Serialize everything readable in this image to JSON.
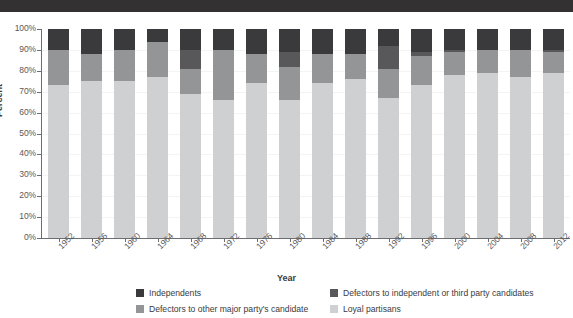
{
  "title_band": {
    "text": ""
  },
  "axes": {
    "ylabel": "Percent",
    "xlabel": "Year",
    "yticks": [
      "0%",
      "10%",
      "20%",
      "30%",
      "40%",
      "50%",
      "60%",
      "70%",
      "80%",
      "90%",
      "100%"
    ]
  },
  "legend": {
    "items": [
      {
        "label": "Independents",
        "color": "#3a3a3c",
        "col": 0,
        "row": 0
      },
      {
        "label": "Defectors to independent or third party candidates",
        "color": "#58585b",
        "col": 1,
        "row": 0
      },
      {
        "label": "Defectors to other major party's candidate",
        "color": "#939597",
        "col": 0,
        "row": 1
      },
      {
        "label": "Loyal partisans",
        "color": "#cfd0d2",
        "col": 1,
        "row": 1
      }
    ]
  },
  "colors": {
    "independents": "#3a3a3c",
    "defectors_independent_third": "#58585b",
    "defectors_other_major": "#939597",
    "loyal_partisans": "#cfd0d2",
    "axis": "#6d6e71",
    "title_band": "#333132",
    "background": "#ffffff"
  },
  "chart_data": {
    "type": "bar",
    "stacked": true,
    "stack_total": 100,
    "title": "",
    "xlabel": "Year",
    "ylabel": "Percent",
    "ylim": [
      0,
      100
    ],
    "ytick_step": 10,
    "grid": false,
    "legend_position": "bottom",
    "categories": [
      "1952",
      "1956",
      "1960",
      "1964",
      "1968",
      "1972",
      "1976",
      "1980",
      "1984",
      "1988",
      "1992",
      "1996",
      "2000",
      "2004",
      "2008",
      "2012"
    ],
    "series": [
      {
        "name": "Loyal partisans",
        "color": "#cfd0d2",
        "values": [
          73,
          75,
          75,
          77,
          69,
          66,
          74,
          66,
          74,
          76,
          67,
          73,
          78,
          79,
          77,
          79
        ]
      },
      {
        "name": "Defectors to other major party's candidate",
        "color": "#939597",
        "values": [
          17,
          13,
          15,
          17,
          12,
          24,
          14,
          16,
          14,
          12,
          14,
          14,
          11,
          11,
          13,
          10
        ]
      },
      {
        "name": "Defectors to independent or third party candidates",
        "color": "#58585b",
        "values": [
          0,
          0,
          0,
          0,
          9,
          0,
          0,
          7,
          0,
          0,
          11,
          2,
          1,
          0,
          0,
          1
        ]
      },
      {
        "name": "Independents",
        "color": "#3a3a3c",
        "values": [
          10,
          12,
          10,
          6,
          10,
          10,
          12,
          11,
          12,
          12,
          8,
          11,
          10,
          10,
          10,
          10
        ]
      }
    ]
  }
}
